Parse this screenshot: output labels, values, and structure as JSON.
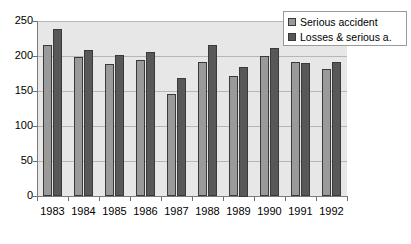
{
  "chart_data": {
    "type": "bar",
    "title": "",
    "subtitle": "",
    "xlabel": "",
    "ylabel": "",
    "categories": [
      "1983",
      "1984",
      "1985",
      "1986",
      "1987",
      "1988",
      "1989",
      "1990",
      "1991",
      "1992"
    ],
    "series": [
      {
        "name": "Serious accident",
        "color": "#9a9a9a",
        "values": [
          216,
          199,
          188,
          194,
          146,
          192,
          171,
          200,
          192,
          181
        ]
      },
      {
        "name": "Losses & serious a.",
        "color": "#585858",
        "values": [
          239,
          208,
          202,
          206,
          169,
          216,
          185,
          211,
          190,
          192
        ]
      }
    ],
    "ylim": [
      0,
      250
    ],
    "yticks": [
      0,
      50,
      100,
      150,
      200,
      250
    ],
    "ytick_labels": [
      "0",
      "50",
      "100",
      "150",
      "200",
      "250"
    ],
    "grid": true,
    "grid_axis": "y",
    "legend_position": "top-right",
    "plot_background": "#e7e7e7",
    "figure_background": "#ffffff"
  },
  "legend": {
    "items": [
      {
        "label": "Serious accident"
      },
      {
        "label": "Losses & serious a."
      }
    ]
  }
}
